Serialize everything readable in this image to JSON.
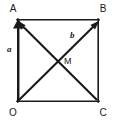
{
  "figure": {
    "kind": "vector-geometry-diagram",
    "background_color": "#ffffff",
    "ink_color": "#1a1a1a",
    "vertices": [
      {
        "id": "A",
        "label": "A",
        "x": 17,
        "y": 19,
        "label_x": 13,
        "label_y": 12
      },
      {
        "id": "B",
        "label": "B",
        "x": 99,
        "y": 19,
        "label_x": 95,
        "label_y": 12
      },
      {
        "id": "O",
        "label": "O",
        "x": 17,
        "y": 102,
        "label_x": 13,
        "label_y": 116
      },
      {
        "id": "C",
        "label": "C",
        "x": 99,
        "y": 102,
        "label_x": 95,
        "label_y": 116
      }
    ],
    "square": {
      "left": 17,
      "top": 19,
      "right": 99,
      "bottom": 102
    },
    "vectors": [
      {
        "id": "a",
        "label": "a",
        "from": "O",
        "to": "A",
        "label_x": 7,
        "label_y": 52
      },
      {
        "id": "b",
        "label": "b",
        "from": "O",
        "to": "B",
        "label_x": 70,
        "label_y": 38
      }
    ],
    "diagonals": [
      {
        "id": "CA",
        "from": "C",
        "to": "A"
      }
    ],
    "intersection": {
      "id": "M",
      "label": "M",
      "x": 58,
      "y": 60,
      "label_x": 64,
      "label_y": 64
    }
  }
}
